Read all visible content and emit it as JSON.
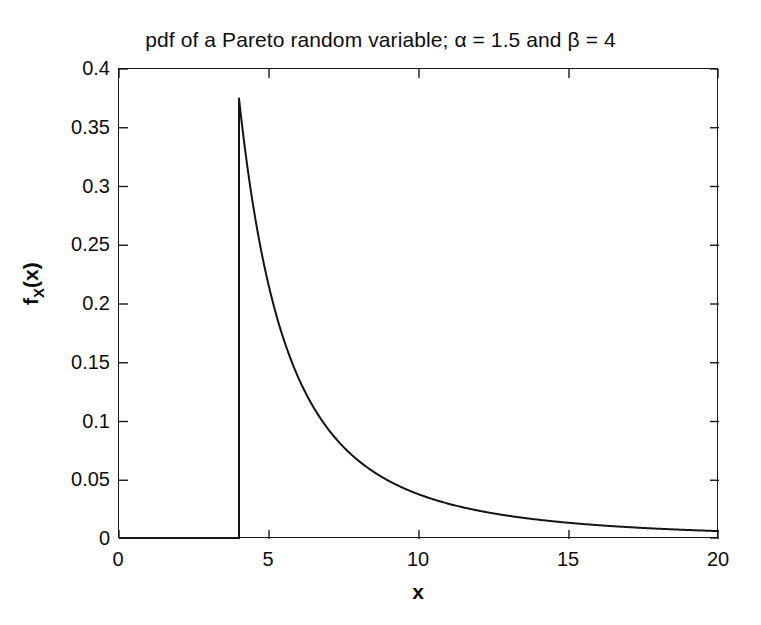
{
  "chart_data": {
    "type": "line",
    "title": "pdf of a Pareto random variable; α = 1.5 and β = 4",
    "xlabel": "x",
    "ylabel": "f_X(x)",
    "ylabel_main": "f",
    "ylabel_subscript": "X",
    "ylabel_arg": "(x)",
    "xlim": [
      0,
      20
    ],
    "ylim": [
      0,
      0.4
    ],
    "grid": false,
    "legend": null,
    "xticks": [
      0,
      5,
      10,
      15,
      20
    ],
    "xtick_labels": [
      "0",
      "5",
      "10",
      "15",
      "20"
    ],
    "yticks": [
      0,
      0.05,
      0.1,
      0.15,
      0.2,
      0.25,
      0.3,
      0.35,
      0.4
    ],
    "ytick_labels": [
      "0",
      "0.05",
      "0.1",
      "0.15",
      "0.2",
      "0.25",
      "0.3",
      "0.35",
      "0.4"
    ],
    "line_color": "#141414",
    "line_width": 2,
    "parameters": {
      "alpha": 1.5,
      "beta": 4
    },
    "formula": "f(x) = alpha*beta^alpha / x^(alpha+1) for x >= beta, else 0",
    "peak": {
      "x": 4,
      "y": 0.375
    },
    "series": [
      {
        "name": "Pareto pdf",
        "x": [
          0,
          1,
          2,
          3,
          3.99,
          4,
          4.25,
          4.5,
          4.75,
          5,
          5.5,
          6,
          6.5,
          7,
          7.5,
          8,
          8.5,
          9,
          9.5,
          10,
          11,
          12,
          13,
          14,
          15,
          16,
          17,
          18,
          19,
          20
        ],
        "values": [
          0,
          0,
          0,
          0,
          0,
          0.375,
          0.3424,
          0.3143,
          0.2898,
          0.2683,
          0.2327,
          0.2041,
          0.1809,
          0.1617,
          0.1457,
          0.1326,
          0.1213,
          0.1111,
          0.1024,
          0.0949,
          0.0822,
          0.0722,
          0.064,
          0.0572,
          0.0516,
          0.0469,
          0.0428,
          0.0393,
          0.0362,
          0.0335
        ]
      }
    ],
    "tail_note": "monotonically decreasing heavy tail approaching 0"
  },
  "axes": {
    "box_border_color": "#1a1a1a",
    "background": "#ffffff"
  }
}
